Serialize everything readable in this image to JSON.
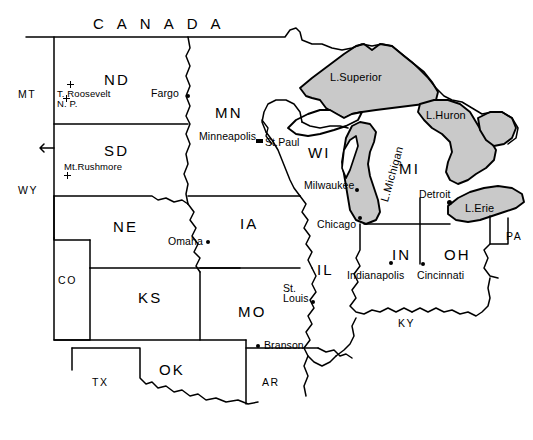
{
  "map": {
    "title": "Midwest United States reference map",
    "background_color": "#ffffff",
    "ink_color": "#000000",
    "lake_fill_color": "#c9c9c9",
    "country_labels": [
      {
        "name": "canada",
        "text": "CANADA",
        "x": 93,
        "y": 16
      }
    ],
    "state_labels": [
      {
        "name": "mt",
        "text": "MT",
        "x": 18,
        "y": 89,
        "size": "small"
      },
      {
        "name": "wy",
        "text": "WY",
        "x": 18,
        "y": 185,
        "size": "small"
      },
      {
        "name": "co",
        "text": "CO",
        "x": 58,
        "y": 275,
        "size": "small"
      },
      {
        "name": "tx",
        "text": "TX",
        "x": 92,
        "y": 377,
        "size": "small"
      },
      {
        "name": "ar",
        "text": "AR",
        "x": 262,
        "y": 377,
        "size": "small"
      },
      {
        "name": "ky",
        "text": "KY",
        "x": 398,
        "y": 318,
        "size": "small"
      },
      {
        "name": "pa",
        "text": "PA",
        "x": 506,
        "y": 231,
        "size": "small"
      },
      {
        "name": "nd",
        "text": "ND",
        "x": 104,
        "y": 72,
        "size": "large"
      },
      {
        "name": "sd",
        "text": "SD",
        "x": 104,
        "y": 143,
        "size": "large"
      },
      {
        "name": "ne",
        "text": "NE",
        "x": 113,
        "y": 219,
        "size": "large"
      },
      {
        "name": "ks",
        "text": "KS",
        "x": 138,
        "y": 290,
        "size": "large"
      },
      {
        "name": "ok",
        "text": "OK",
        "x": 159,
        "y": 362,
        "size": "large"
      },
      {
        "name": "mn",
        "text": "MN",
        "x": 215,
        "y": 105,
        "size": "large"
      },
      {
        "name": "ia",
        "text": "IA",
        "x": 240,
        "y": 216,
        "size": "large"
      },
      {
        "name": "mo",
        "text": "MO",
        "x": 238,
        "y": 304,
        "size": "large"
      },
      {
        "name": "il",
        "text": "IL",
        "x": 317,
        "y": 262,
        "size": "large"
      },
      {
        "name": "wi",
        "text": "WI",
        "x": 308,
        "y": 145,
        "size": "large"
      },
      {
        "name": "in",
        "text": "IN",
        "x": 392,
        "y": 247,
        "size": "large"
      },
      {
        "name": "oh",
        "text": "OH",
        "x": 444,
        "y": 247,
        "size": "large"
      },
      {
        "name": "mi",
        "text": "MI",
        "x": 399,
        "y": 161,
        "size": "large"
      }
    ],
    "lake_labels": [
      {
        "name": "lake-superior",
        "text": "L.Superior",
        "x": 330,
        "y": 72,
        "rotated": false
      },
      {
        "name": "lake-huron",
        "text": "L.Huron",
        "x": 426,
        "y": 110,
        "rotated": false
      },
      {
        "name": "lake-erie",
        "text": "L.Erie",
        "x": 465,
        "y": 203,
        "rotated": false
      },
      {
        "name": "lake-michigan",
        "text": "L.Michigan",
        "x": 379,
        "y": 200,
        "rotated": true
      }
    ],
    "cities": [
      {
        "name": "fargo",
        "text": "Fargo",
        "x": 151,
        "y": 88,
        "dot_x": 186,
        "dot_y": 94,
        "marker": "dot",
        "anchor": "left"
      },
      {
        "name": "minneapolis",
        "text": "Minneapolis",
        "x": 199,
        "y": 131,
        "dot_x": 256,
        "dot_y": 139,
        "marker": "square",
        "anchor": "left"
      },
      {
        "name": "st-paul",
        "text": "St.Paul",
        "x": 265,
        "y": 137,
        "dot_x": null,
        "dot_y": null,
        "marker": "none",
        "anchor": "left"
      },
      {
        "name": "milwaukee",
        "text": "Milwaukee",
        "x": 304,
        "y": 180,
        "dot_x": 355,
        "dot_y": 188,
        "marker": "dot",
        "anchor": "left"
      },
      {
        "name": "chicago",
        "text": "Chicago",
        "x": 317,
        "y": 219,
        "dot_x": 358,
        "dot_y": 216,
        "marker": "dot",
        "anchor": "left"
      },
      {
        "name": "omaha",
        "text": "Omaha",
        "x": 168,
        "y": 236,
        "dot_x": 206,
        "dot_y": 240,
        "marker": "dot",
        "anchor": "left"
      },
      {
        "name": "detroit",
        "text": "Detroit",
        "x": 419,
        "y": 189,
        "dot_x": 447,
        "dot_y": 200,
        "marker": "big",
        "anchor": "left"
      },
      {
        "name": "indianapolis",
        "text": "Indianapolis",
        "x": 347,
        "y": 270,
        "dot_x": 389,
        "dot_y": 261,
        "marker": "dot",
        "anchor": "left"
      },
      {
        "name": "cincinnati",
        "text": "Cincinnati",
        "x": 417,
        "y": 270,
        "dot_x": 421,
        "dot_y": 262,
        "marker": "dot",
        "anchor": "left"
      },
      {
        "name": "branson",
        "text": "Branson",
        "x": 264,
        "y": 340,
        "dot_x": 256,
        "dot_y": 344,
        "marker": "dot",
        "anchor": "left"
      }
    ],
    "cities_multiline": [
      {
        "name": "st-louis",
        "lines": [
          "St.",
          "Louis"
        ],
        "x": 283,
        "y": 283,
        "dot_x": 311,
        "dot_y": 300,
        "marker": "dot"
      }
    ],
    "landmarks": [
      {
        "name": "theodore-roosevelt-np",
        "lines": [
          "T. Roosevelt",
          "N. P."
        ],
        "x": 57,
        "y": 89,
        "markers": [
          {
            "x": 67,
            "y": 81
          },
          {
            "x": 63,
            "y": 95
          }
        ]
      },
      {
        "name": "mount-rushmore",
        "lines": [
          "Mt.Rushmore"
        ],
        "x": 64,
        "y": 162,
        "markers": [
          {
            "x": 64,
            "y": 172
          }
        ]
      }
    ],
    "legend_notes": []
  }
}
